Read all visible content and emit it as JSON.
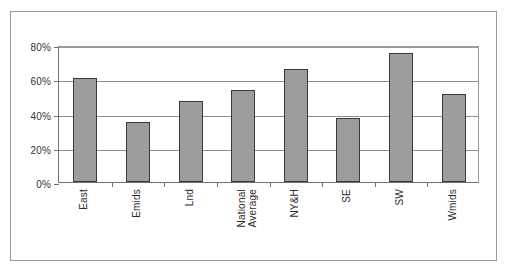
{
  "chart_data": {
    "type": "bar",
    "title": "",
    "xlabel": "",
    "ylabel": "",
    "categories": [
      "East",
      "Emids",
      "Lnd",
      "National Average",
      "NY&H",
      "SE",
      "SW",
      "Wmids"
    ],
    "category_labels_multiline": [
      "East",
      "Emids",
      "Lnd",
      "National\nAverage",
      "NY&H",
      "SE",
      "SW",
      "Wmids"
    ],
    "values": [
      60.5,
      35,
      47.5,
      53.5,
      66,
      37.5,
      75.5,
      51.5
    ],
    "value_labels": [
      "60.5%",
      "35%",
      "47.5%",
      "53.5%",
      "66%",
      "37.5%",
      "75.5%",
      "51.5%"
    ],
    "ylim": [
      0,
      80
    ],
    "yticks": [
      0,
      20,
      40,
      60,
      80
    ],
    "ytick_labels": [
      "0%",
      "20%",
      "40%",
      "60%",
      "80%"
    ],
    "grid": true,
    "legend": false,
    "legend_position": "none",
    "series_name": "",
    "bar_fill_color": "#9d9d9d",
    "bar_border_color": "#3a3a3a",
    "gridline_color": "#8e8e8e",
    "axis_color": "#6f6f6f",
    "frame_color": "#9a9a9a",
    "background_color": "#ffffff",
    "tick_label_color": "#333333"
  },
  "title_ghost": ""
}
